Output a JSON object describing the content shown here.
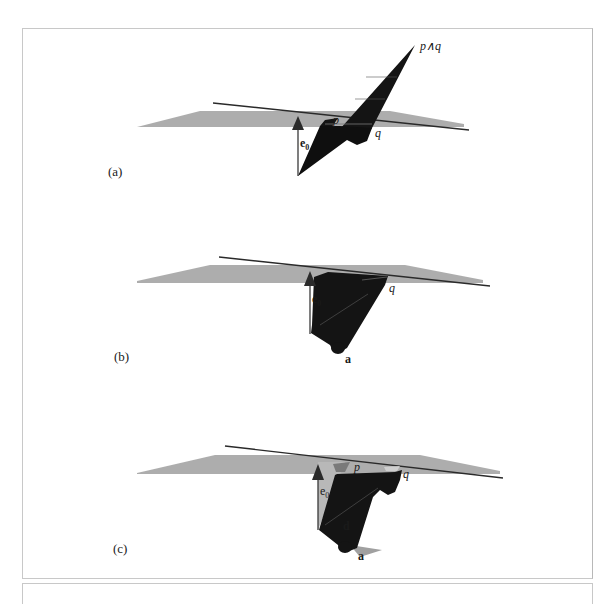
{
  "figure": {
    "panels": [
      {
        "id": "a",
        "caption": "(a)",
        "labels": {
          "wedge": "p∧q",
          "p": "p",
          "q": "q",
          "basis": "e",
          "basis_sub": "0"
        }
      },
      {
        "id": "b",
        "caption": "(b)",
        "labels": {
          "q": "q",
          "basis": "e",
          "basis_sub": "0",
          "vector": "a"
        }
      },
      {
        "id": "c",
        "caption": "(c)",
        "labels": {
          "p": "p",
          "q": "q",
          "basis": "e",
          "basis_sub": "0",
          "direction": "d",
          "vector": "a"
        }
      }
    ],
    "colors": {
      "plane": "#a9a9a9",
      "wedge": "#141414",
      "line": "#2a2a2a",
      "arrow": "#3a3a3a",
      "frame": "#c8c8c8"
    }
  }
}
